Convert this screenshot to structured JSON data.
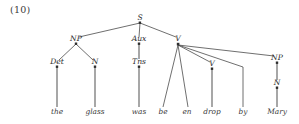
{
  "figure": {
    "example_number": "(10)",
    "type": "syntax-tree",
    "sentence": "the glass was be en drop by Mary",
    "ink_color": "#2e2e2e",
    "line_color": "#4a4a4a",
    "stem_color": "#8a8a8a",
    "background": "#ffffff"
  },
  "nodes": {
    "s": {
      "label": "S",
      "x": 140,
      "y": 20
    },
    "np_subject": {
      "label": "NP",
      "x": 76,
      "y": 41
    },
    "aux": {
      "label": "Aux",
      "x": 139,
      "y": 41
    },
    "v_top": {
      "label": "V",
      "x": 178,
      "y": 41
    },
    "det": {
      "label": "Det",
      "x": 57,
      "y": 64
    },
    "n_subject": {
      "label": "N",
      "x": 95,
      "y": 64
    },
    "tns": {
      "label": "Tns",
      "x": 139,
      "y": 64
    },
    "v_lower": {
      "label": "V",
      "x": 212,
      "y": 66
    },
    "np_object": {
      "label": "NP",
      "x": 277,
      "y": 60
    },
    "n_object": {
      "label": "N",
      "x": 277,
      "y": 85
    }
  },
  "terminals": [
    {
      "word": "the",
      "x": 57,
      "y": 114
    },
    {
      "word": "glass",
      "x": 95,
      "y": 114
    },
    {
      "word": "was",
      "x": 139,
      "y": 114
    },
    {
      "word": "be",
      "x": 163,
      "y": 114
    },
    {
      "word": "en",
      "x": 187,
      "y": 114
    },
    {
      "word": "drop",
      "x": 212,
      "y": 114
    },
    {
      "word": "by",
      "x": 243,
      "y": 114
    },
    {
      "word": "Mary",
      "x": 277,
      "y": 114
    }
  ]
}
